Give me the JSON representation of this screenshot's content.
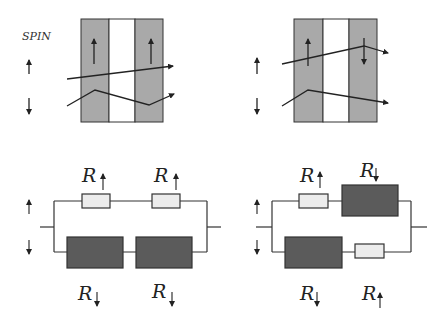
{
  "spin_label": "SPIN",
  "colors": {
    "ferromagnet": "#a9a9a9",
    "spacer": "#ffffff",
    "low_resistor": "#ececec",
    "high_resistor": "#5b5b5b",
    "line": "#222222"
  },
  "panels": {
    "parallel": {
      "layer_magnetization": [
        "up",
        "up"
      ],
      "circuit": {
        "top_channel": {
          "spin": "up",
          "resistors": [
            {
              "label": "R",
              "spin": "up",
              "size": "small"
            },
            {
              "label": "R",
              "spin": "up",
              "size": "small"
            }
          ]
        },
        "bottom_channel": {
          "spin": "down",
          "resistors": [
            {
              "label": "R",
              "spin": "down",
              "size": "large"
            },
            {
              "label": "R",
              "spin": "down",
              "size": "large"
            }
          ]
        }
      }
    },
    "antiparallel": {
      "layer_magnetization": [
        "up",
        "down"
      ],
      "circuit": {
        "top_channel": {
          "spin": "up",
          "resistors": [
            {
              "label": "R",
              "spin": "up",
              "size": "small"
            },
            {
              "label": "R",
              "spin": "down",
              "size": "large"
            }
          ]
        },
        "bottom_channel": {
          "spin": "down",
          "resistors": [
            {
              "label": "R",
              "spin": "down",
              "size": "large"
            },
            {
              "label": "R",
              "spin": "up",
              "size": "small"
            }
          ]
        }
      }
    }
  },
  "labels": {
    "r_symbol": "R",
    "up_arrow": "↑",
    "down_arrow": "↓"
  }
}
